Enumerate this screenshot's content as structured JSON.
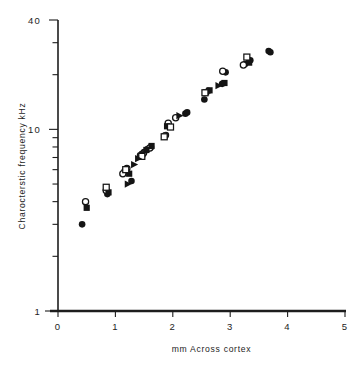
{
  "chart_data": {
    "type": "scatter",
    "title": "",
    "xlabel": "mm  Across  cortex",
    "ylabel": "Charocterstic  frequency  kHz",
    "xlim": [
      0,
      5
    ],
    "ylim": [
      1,
      40
    ],
    "yscale": "log",
    "xscale": "linear",
    "grid": false,
    "legend": "none",
    "x_ticks": [
      "0",
      "1",
      "2",
      "3",
      "4",
      "5"
    ],
    "x_tick_values": [
      0,
      1,
      2,
      3,
      4,
      5
    ],
    "y_ticks_labeled": [
      "40",
      "10",
      "1"
    ],
    "y_tick_values_labeled": [
      40,
      10,
      1
    ],
    "y_minor_ticks": [
      30,
      20,
      9,
      8,
      7,
      6,
      5,
      4,
      3,
      2
    ],
    "series": [
      {
        "name": "filled-circle",
        "marker": "filled-circle",
        "points": [
          [
            0.42,
            3.0
          ],
          [
            0.86,
            4.4
          ],
          [
            1.16,
            5.9
          ],
          [
            1.28,
            5.2
          ],
          [
            1.43,
            7.2
          ],
          [
            1.5,
            7.5
          ],
          [
            1.56,
            7.8
          ],
          [
            1.62,
            8.0
          ],
          [
            1.88,
            9.3
          ],
          [
            1.93,
            10.6
          ],
          [
            2.22,
            12.2
          ],
          [
            2.25,
            12.4
          ],
          [
            2.55,
            14.6
          ],
          [
            2.62,
            16.3
          ],
          [
            2.86,
            17.8
          ],
          [
            2.92,
            20.6
          ],
          [
            3.26,
            22.9
          ],
          [
            3.35,
            24.0
          ],
          [
            3.67,
            27.0
          ],
          [
            3.7,
            26.6
          ]
        ]
      },
      {
        "name": "open-circle",
        "marker": "open-circle",
        "points": [
          [
            0.48,
            4.0
          ],
          [
            0.84,
            4.6
          ],
          [
            1.13,
            5.7
          ],
          [
            1.2,
            6.1
          ],
          [
            1.49,
            7.4
          ],
          [
            1.6,
            7.9
          ],
          [
            1.86,
            9.2
          ],
          [
            1.92,
            10.8
          ],
          [
            2.05,
            11.6
          ],
          [
            2.87,
            20.9
          ],
          [
            3.23,
            22.6
          ]
        ]
      },
      {
        "name": "filled-square",
        "marker": "filled-square",
        "points": [
          [
            0.5,
            3.7
          ],
          [
            0.88,
            4.5
          ],
          [
            1.24,
            5.7
          ],
          [
            1.47,
            7.3
          ],
          [
            1.54,
            7.7
          ],
          [
            1.63,
            8.1
          ],
          [
            1.9,
            10.4
          ],
          [
            2.58,
            16.0
          ],
          [
            2.64,
            16.4
          ],
          [
            2.9,
            18.0
          ],
          [
            3.33,
            23.3
          ]
        ]
      },
      {
        "name": "open-square",
        "marker": "open-square",
        "points": [
          [
            0.84,
            4.8
          ],
          [
            1.18,
            6.0
          ],
          [
            1.46,
            7.1
          ],
          [
            1.85,
            9.1
          ],
          [
            1.96,
            10.3
          ],
          [
            2.56,
            15.9
          ],
          [
            3.29,
            25.0
          ]
        ]
      },
      {
        "name": "filled-triangle",
        "marker": "filled-triangle",
        "points": [
          [
            1.22,
            5.0
          ],
          [
            1.33,
            6.4
          ],
          [
            1.4,
            6.9
          ],
          [
            2.12,
            11.9
          ],
          [
            2.8,
            17.4
          ]
        ]
      }
    ]
  }
}
